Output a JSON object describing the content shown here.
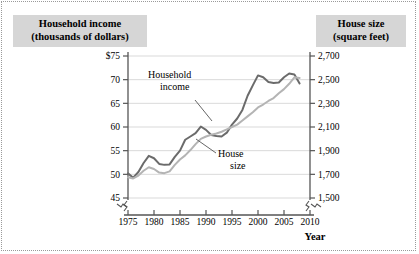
{
  "figure": {
    "left_title": {
      "line1": "Household income",
      "line2": "(thousands of dollars)"
    },
    "right_title": {
      "line1": "House size",
      "line2": "(square feet)"
    },
    "xaxis_name": "Year",
    "background_color": "#ffffff",
    "title_box_color": "#d6d6d6",
    "gridline_color": "#cfcfcf",
    "axis_color": "#555555"
  },
  "chart_data": {
    "type": "line",
    "title": "",
    "subtitle": "",
    "xlabel": "Year",
    "ylabel": "Household income (thousands of dollars)",
    "y2label": "House size (square feet)",
    "grid": true,
    "legend": "annotations",
    "legend_position": "inline-callouts",
    "xlim": [
      1975,
      2010
    ],
    "xticks": [
      1975,
      1980,
      1985,
      1990,
      1995,
      2000,
      2005,
      2010
    ],
    "xticklabels": [
      "1975",
      "1980",
      "1985",
      "1990",
      "1995",
      "2000",
      "2005",
      "2010"
    ],
    "ylim": [
      45,
      75
    ],
    "yticks": [
      45,
      50,
      55,
      60,
      65,
      70,
      75
    ],
    "yticklabels": [
      "45",
      "50",
      "55",
      "60",
      "65",
      "70",
      "$75"
    ],
    "y2lim": [
      1500,
      2700
    ],
    "y2ticks": [
      1500,
      1700,
      1900,
      2100,
      2300,
      2500,
      2700
    ],
    "y2ticklabels": [
      "1,500",
      "1,700",
      "1,900",
      "2,100",
      "2,300",
      "2,500",
      "2,700"
    ],
    "axis_break": true,
    "axis_break_note": "zigzag break marks on both y-axes below lowest tick and on x-axis before 1975 and after 2010",
    "annotations": [
      {
        "text_line1": "Household",
        "text_line2": "income",
        "target_series": "Household income"
      },
      {
        "text_line1": "House",
        "text_line2": "size",
        "target_series": "House size"
      }
    ],
    "x": [
      1975,
      1976,
      1977,
      1978,
      1979,
      1980,
      1981,
      1982,
      1983,
      1984,
      1985,
      1986,
      1987,
      1988,
      1989,
      1990,
      1991,
      1992,
      1993,
      1994,
      1995,
      1996,
      1997,
      1998,
      1999,
      2000,
      2001,
      2002,
      2003,
      2004,
      2005,
      2006,
      2007,
      2008
    ],
    "series": [
      {
        "name": "Household income",
        "axis": "left",
        "units": "thousands of dollars",
        "color": "#6b6b6b",
        "values": [
          50.2,
          49.3,
          50.5,
          52.4,
          53.9,
          53.4,
          52.2,
          52.0,
          52.1,
          53.7,
          55.0,
          57.3,
          58.0,
          58.7,
          60.1,
          59.4,
          58.3,
          58.1,
          58.0,
          58.8,
          60.5,
          61.8,
          63.6,
          66.6,
          68.8,
          70.9,
          70.5,
          69.5,
          69.3,
          69.4,
          70.5,
          71.3,
          71.1,
          69.2
        ]
      },
      {
        "name": "House size",
        "axis": "right",
        "units": "square feet",
        "color": "#b4b4b4",
        "values": [
          1675,
          1665,
          1690,
          1730,
          1760,
          1745,
          1715,
          1710,
          1725,
          1780,
          1825,
          1860,
          1905,
          1955,
          2000,
          2020,
          2035,
          2045,
          2060,
          2080,
          2100,
          2120,
          2155,
          2190,
          2225,
          2265,
          2290,
          2320,
          2345,
          2385,
          2420,
          2465,
          2520,
          2515
        ]
      }
    ]
  }
}
